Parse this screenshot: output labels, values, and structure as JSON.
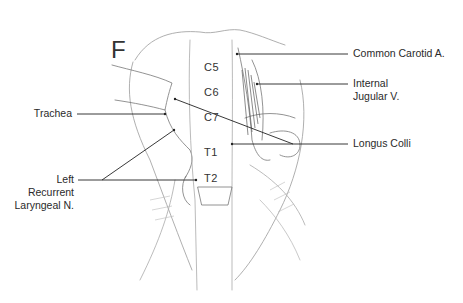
{
  "figure": {
    "panel_letter": "F",
    "vertebrae": [
      {
        "label": "C5"
      },
      {
        "label": "C6"
      },
      {
        "label": "C7"
      },
      {
        "label": "T1"
      },
      {
        "label": "T2"
      }
    ],
    "labels_right": [
      {
        "text": "Common Carotid A."
      },
      {
        "text_line1": "Internal",
        "text_line2": "Jugular V."
      },
      {
        "text": "Longus Colli"
      }
    ],
    "labels_left": [
      {
        "text": "Trachea"
      },
      {
        "text_line1": "Left",
        "text_line2": "Recurrent",
        "text_line3": "Laryngeal N."
      }
    ],
    "colors": {
      "ink": "#2a2a2a",
      "sketch": "#8a8a8a",
      "background": "#ffffff"
    }
  }
}
